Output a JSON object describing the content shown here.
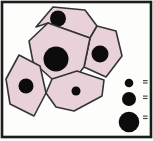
{
  "figure": {
    "type": "cell-tissue-diagram",
    "colors": {
      "background": "#fdfdfc",
      "frame": "#1c1c1c",
      "cell_fill": "#e8d1d9",
      "cell_stroke": "#343434",
      "nucleus": "#0c0c0c",
      "label_mark": "#4a4a4a"
    },
    "frame": {
      "x": 2,
      "y": 2,
      "width": 149,
      "height": 135,
      "stroke_width": 2.6
    },
    "cells": [
      {
        "name": "top-cell",
        "points": "36,27 53,7 85,10 97,26 90,38 48,23",
        "nucleus": {
          "cx": 58,
          "cy": 18.5,
          "r": 8
        }
      },
      {
        "name": "right-cell",
        "points": "90,38 97,26 116,31 122,56 106,77 84,67",
        "nucleus": {
          "cx": 100,
          "cy": 54,
          "r": 8.5
        }
      },
      {
        "name": "center-cell",
        "points": "29,41 48,23 90,38 84,67 77,76 52,79 33,62",
        "nucleus": {
          "cx": 56,
          "cy": 59,
          "r": 12.5
        }
      },
      {
        "name": "left-cell",
        "points": "19,55 40,66 46,93 34,116 10,104 6,79",
        "nucleus": {
          "cx": 26,
          "cy": 86,
          "r": 7.5
        }
      },
      {
        "name": "bottom-cell",
        "points": "52,79 77,71 104,80 102,96 74,111 56,107 46,93",
        "nucleus": {
          "cx": 76,
          "cy": 91,
          "r": 4.5
        }
      }
    ],
    "legend": [
      {
        "name": "key-circle-small",
        "cx": 129,
        "cy": 83,
        "r": 4.3,
        "marks": 2,
        "mark_x": 143,
        "mark_y": 80
      },
      {
        "name": "key-circle-medium",
        "cx": 129,
        "cy": 99,
        "r": 7,
        "marks": 2,
        "mark_x": 143,
        "mark_y": 95.5
      },
      {
        "name": "key-circle-large",
        "cx": 129,
        "cy": 122,
        "r": 10.3,
        "marks": 2,
        "mark_x": 143,
        "mark_y": 115.5
      }
    ],
    "mark": {
      "width": 4.6,
      "height": 1.2,
      "gap": 2.4
    }
  }
}
